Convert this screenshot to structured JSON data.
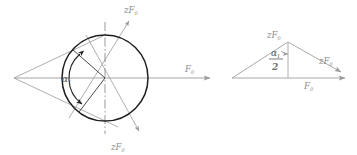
{
  "figure": {
    "title": "",
    "left_diagram": {
      "name": "friction-cone-circle-diagram",
      "labels": {
        "axis_top": {
          "base": "zF",
          "sub": "0"
        },
        "axis_bottom": {
          "base": "zF",
          "sub": "0"
        },
        "axis_horizontal": {
          "base": "F",
          "sub": "0"
        },
        "angle": {
          "base": "α",
          "sub": "1"
        }
      },
      "geometry": {
        "apex_x": 14,
        "apex_y": 78,
        "circle_cx": 105,
        "circle_cy": 78,
        "circle_r": 43
      }
    },
    "right_diagram": {
      "name": "force-triangle-diagram",
      "labels": {
        "top_vertex": {
          "base": "zF",
          "sub": "0"
        },
        "hypotenuse_arrow": {
          "base": "zF",
          "sub": "0"
        },
        "base_arrow": {
          "base": "F",
          "sub": "0"
        },
        "half_angle": {
          "numerator_base": "α",
          "numerator_sub": "1",
          "denominator": "2"
        }
      },
      "geometry": {
        "left_x": 232,
        "base_y": 78,
        "top_x": 288,
        "top_y": 42,
        "right_x": 341,
        "right_y": 72
      }
    },
    "colors": {
      "line_gray": "#9a9a9a",
      "line_dark": "#2b2b2b",
      "label_gray": "#8d8d8d",
      "background": "#ffffff"
    }
  }
}
